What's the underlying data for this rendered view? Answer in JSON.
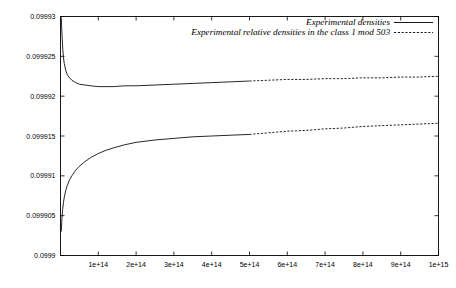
{
  "chart_data": {
    "type": "line",
    "title": "",
    "xlabel": "",
    "ylabel": "",
    "grid": false,
    "legend_position": "top-right",
    "xlim": [
      0,
      1000000000000000.0
    ],
    "ylim": [
      0.0999,
      0.09993
    ],
    "xticks": [
      100000000000000.0,
      200000000000000.0,
      300000000000000.0,
      400000000000000.0,
      500000000000000.0,
      600000000000000.0,
      700000000000000.0,
      800000000000000.0,
      900000000000000.0,
      1000000000000000.0
    ],
    "xtick_labels": [
      "1e+14",
      "2e+14",
      "3e+14",
      "4e+14",
      "5e+14",
      "6e+14",
      "7e+14",
      "8e+14",
      "9e+14",
      "1e+15"
    ],
    "yticks": [
      0.0999,
      0.099905,
      0.09991,
      0.099915,
      0.09992,
      0.099925,
      0.09993
    ],
    "ytick_labels": [
      "0.0999",
      "0.099905",
      "0.09991",
      "0.099915",
      "0.09992",
      "0.099925",
      "0.09993"
    ],
    "series": [
      {
        "name": "Experimental densities",
        "style": "solid",
        "measured_until": 500000000000000.0,
        "x": [
          2000000000000.0,
          4000000000000.0,
          6000000000000.0,
          8000000000000.0,
          10000000000000.0,
          14000000000000.0,
          18000000000000.0,
          24000000000000.0,
          30000000000000.0,
          40000000000000.0,
          50000000000000.0,
          65000000000000.0,
          80000000000000.0,
          100000000000000.0,
          120000000000000.0,
          140000000000000.0,
          170000000000000.0,
          200000000000000.0,
          250000000000000.0,
          300000000000000.0,
          350000000000000.0,
          400000000000000.0,
          450000000000000.0,
          500000000000000.0
        ],
        "y": [
          0.0999299,
          0.0999277,
          0.0999259,
          0.0999248,
          0.0999241,
          0.0999232,
          0.0999227,
          0.0999223,
          0.099922,
          0.0999217,
          0.0999215,
          0.0999214,
          0.0999213,
          0.0999212,
          0.0999212,
          0.0999212,
          0.0999213,
          0.0999213,
          0.0999214,
          0.0999215,
          0.0999216,
          0.0999217,
          0.0999218,
          0.0999219
        ]
      },
      {
        "name": "Experimental relative densities in the class 1 mod 503",
        "style": "dashed",
        "extrapolated_from": 500000000000000.0,
        "x": [
          500000000000000.0,
          550000000000000.0,
          600000000000000.0,
          650000000000000.0,
          700000000000000.0,
          750000000000000.0,
          800000000000000.0,
          850000000000000.0,
          900000000000000.0,
          950000000000000.0,
          1000000000000000.0
        ],
        "y_upper": [
          0.0999219,
          0.099922,
          0.0999221,
          0.0999221,
          0.0999222,
          0.0999222,
          0.0999223,
          0.0999223,
          0.0999224,
          0.0999224,
          0.0999225
        ],
        "y_lower": [
          0.0999152,
          0.0999154,
          0.0999156,
          0.0999157,
          0.0999159,
          0.099916,
          0.0999162,
          0.0999163,
          0.0999164,
          0.0999165,
          0.0999166
        ]
      },
      {
        "name": "lower-branch-solid",
        "style": "solid",
        "x": [
          2000000000000.0,
          4000000000000.0,
          6000000000000.0,
          8000000000000.0,
          10000000000000.0,
          14000000000000.0,
          18000000000000.0,
          24000000000000.0,
          30000000000000.0,
          40000000000000.0,
          50000000000000.0,
          65000000000000.0,
          80000000000000.0,
          100000000000000.0,
          120000000000000.0,
          140000000000000.0,
          170000000000000.0,
          200000000000000.0,
          250000000000000.0,
          300000000000000.0,
          350000000000000.0,
          400000000000000.0,
          450000000000000.0,
          500000000000000.0
        ],
        "y": [
          0.099903,
          0.0999048,
          0.0999059,
          0.0999067,
          0.0999073,
          0.0999082,
          0.0999088,
          0.0999095,
          0.09991,
          0.0999107,
          0.0999112,
          0.0999118,
          0.0999123,
          0.0999128,
          0.0999132,
          0.0999135,
          0.0999139,
          0.0999142,
          0.0999145,
          0.0999147,
          0.0999149,
          0.099915,
          0.0999151,
          0.0999152
        ]
      }
    ],
    "legend": [
      {
        "label": "Experimental densities",
        "style": "solid"
      },
      {
        "label": "Experimental relative densities in the class 1 mod 503",
        "style": "dashed"
      }
    ]
  },
  "colors": {
    "background": "#ffffff",
    "foreground": "#000000"
  }
}
